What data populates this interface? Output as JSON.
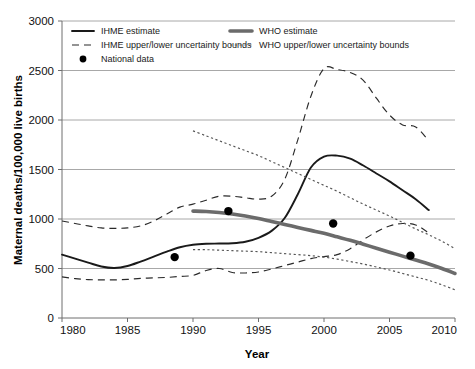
{
  "chart_data": {
    "type": "line",
    "title": "",
    "xlabel": "Year",
    "ylabel": "Maternal deaths/100,000 live births",
    "xlim": [
      1980,
      2010
    ],
    "ylim": [
      0,
      3000
    ],
    "xticks": [
      1980,
      1985,
      1990,
      1995,
      2000,
      2005,
      2010
    ],
    "xtick_labels": [
      "1980",
      "1985",
      "1990",
      "1995",
      "2000",
      "2005",
      "2010"
    ],
    "yticks": [
      0,
      500,
      1000,
      1500,
      2000,
      2500,
      3000
    ],
    "ytick_labels": [
      "0",
      "500",
      "1000",
      "1500",
      "2000",
      "2500",
      "3000"
    ],
    "grid": "horizontal",
    "legend_position": "top-inside",
    "series": [
      {
        "name": "IHME estimate",
        "style": "solid-dark",
        "x": [
          1980,
          1981,
          1982,
          1983,
          1984,
          1985,
          1986,
          1987,
          1988,
          1989,
          1990,
          1991,
          1992,
          1993,
          1994,
          1995,
          1996,
          1997,
          1998,
          1999,
          2000,
          2001,
          2002,
          2003,
          2004,
          2005,
          2006,
          2007,
          2008
        ],
        "values": [
          640,
          600,
          560,
          520,
          505,
          525,
          570,
          620,
          670,
          715,
          740,
          750,
          752,
          755,
          770,
          810,
          880,
          1010,
          1250,
          1520,
          1630,
          1640,
          1610,
          1540,
          1460,
          1380,
          1290,
          1200,
          1090
        ]
      },
      {
        "name": "IHME upper uncertainty bound",
        "style": "dashed-dark",
        "x": [
          1980,
          1981,
          1982,
          1983,
          1984,
          1985,
          1986,
          1987,
          1988,
          1989,
          1990,
          1991,
          1992,
          1993,
          1994,
          1995,
          1996,
          1997,
          1998,
          1999,
          2000,
          2001,
          2002,
          2003,
          2004,
          2005,
          2006,
          2007,
          2008
        ],
        "values": [
          980,
          955,
          930,
          910,
          905,
          910,
          930,
          980,
          1050,
          1120,
          1150,
          1190,
          1230,
          1230,
          1215,
          1200,
          1230,
          1400,
          1800,
          2240,
          2520,
          2510,
          2480,
          2400,
          2220,
          2050,
          1950,
          1930,
          1790
        ]
      },
      {
        "name": "IHME lower uncertainty bound",
        "style": "dashed-dark",
        "x": [
          1980,
          1981,
          1982,
          1983,
          1984,
          1985,
          1986,
          1987,
          1988,
          1989,
          1990,
          1991,
          1992,
          1993,
          1994,
          1995,
          1996,
          1997,
          1998,
          1999,
          2000,
          2001,
          2002,
          2003,
          2004,
          2005,
          2006,
          2007,
          2008
        ],
        "values": [
          415,
          398,
          388,
          385,
          385,
          390,
          400,
          405,
          410,
          420,
          430,
          480,
          500,
          460,
          455,
          465,
          495,
          530,
          565,
          600,
          620,
          640,
          700,
          790,
          870,
          930,
          955,
          940,
          860
        ]
      },
      {
        "name": "WHO estimate",
        "style": "solid-gray",
        "x": [
          1990,
          1991,
          1992,
          1993,
          1994,
          1995,
          1996,
          1997,
          1998,
          1999,
          2000,
          2001,
          2002,
          2003,
          2004,
          2005,
          2006,
          2007,
          2008,
          2009,
          2010
        ],
        "values": [
          1080,
          1075,
          1065,
          1050,
          1030,
          1005,
          975,
          945,
          915,
          885,
          855,
          820,
          785,
          745,
          705,
          665,
          625,
          585,
          545,
          500,
          450
        ]
      },
      {
        "name": "WHO upper uncertainty bound",
        "style": "dotted-gray",
        "x": [
          1990,
          1991,
          1992,
          1993,
          1994,
          1995,
          1996,
          1997,
          1998,
          1999,
          2000,
          2001,
          2002,
          2003,
          2004,
          2005,
          2006,
          2007,
          2008,
          2009,
          2010
        ],
        "values": [
          1890,
          1840,
          1790,
          1740,
          1690,
          1640,
          1580,
          1520,
          1460,
          1400,
          1340,
          1280,
          1215,
          1150,
          1090,
          1030,
          965,
          900,
          840,
          775,
          700
        ]
      },
      {
        "name": "WHO lower uncertainty bound",
        "style": "dotted-gray",
        "x": [
          1990,
          1991,
          1992,
          1993,
          1994,
          1995,
          1996,
          1997,
          1998,
          1999,
          2000,
          2001,
          2002,
          2003,
          2004,
          2005,
          2006,
          2007,
          2008,
          2009,
          2010
        ],
        "values": [
          690,
          690,
          685,
          680,
          675,
          670,
          660,
          650,
          640,
          630,
          615,
          595,
          570,
          545,
          515,
          485,
          450,
          415,
          380,
          335,
          285
        ]
      }
    ],
    "scatter": {
      "name": "National data",
      "marker": "filled-circle",
      "points": [
        {
          "x": 1988.6,
          "y": 615
        },
        {
          "x": 1992.7,
          "y": 1080
        },
        {
          "x": 2000.7,
          "y": 955
        },
        {
          "x": 2006.6,
          "y": 630
        }
      ]
    },
    "legend": [
      {
        "label": "IHME estimate",
        "style": "solid-dark",
        "column": 0
      },
      {
        "label": "IHME upper/lower uncertainty bounds",
        "style": "dashed-dark",
        "column": 0
      },
      {
        "label": "National data",
        "style": "marker-dot",
        "column": 0
      },
      {
        "label": "WHO estimate",
        "style": "solid-gray",
        "column": 1
      },
      {
        "label": "WHO upper/lower uncertainty bounds",
        "style": "dotted-gray",
        "column": 1
      }
    ]
  },
  "colors": {
    "ihme_line": "#1a1a1a",
    "who_line": "#6b6b6b",
    "grid": "#a8a8a8",
    "axis": "#6e6e6e",
    "marker": "#000000",
    "background": "#ffffff"
  }
}
